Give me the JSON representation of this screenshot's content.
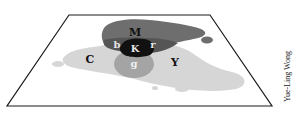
{
  "diagram": {
    "type": "color-overlap-blobs-on-plane",
    "labels": {
      "M": "M",
      "C": "C",
      "Y": "Y",
      "K": "K",
      "b": "b",
      "r": "r",
      "g": "g"
    },
    "credit": "Yue-Ling Wong"
  },
  "colors": {
    "plane_stroke": "#1a1a1a",
    "magenta_region": "#6e6e6e",
    "cyan_yellow_region": "#d6d6d6",
    "green_overlap": "#a4a4a4",
    "blue_red_overlap": "#555555",
    "black_overlap": "#111111"
  }
}
